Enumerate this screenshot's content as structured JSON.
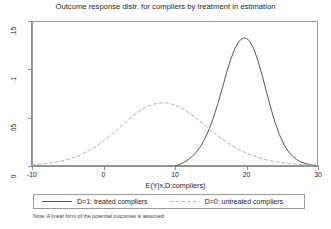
{
  "chart_data": {
    "type": "line",
    "title": "Outcome response distr. for compliers by treatment in estimation",
    "xlabel": "E(Y|x,D;compliers)",
    "ylabel": "",
    "note": "Note: A linear form of the potential outcomes is assumed",
    "grid": false,
    "legend_position": "bottom",
    "xlim": [
      -10,
      30
    ],
    "ylim": [
      0,
      0.15
    ],
    "xticks": [
      -10,
      0,
      10,
      20,
      30
    ],
    "xtick_labels": [
      "-10",
      "0",
      "10",
      "20",
      "30"
    ],
    "yticks": [
      0,
      0.05,
      0.1,
      0.15
    ],
    "ytick_labels": [
      "0",
      ".05",
      ".1",
      ".15"
    ],
    "series": [
      {
        "name": "D=1: treated compliers",
        "style": "solid",
        "color": "#555555",
        "x": [
          10.0,
          10.6,
          11.2,
          11.8,
          12.4,
          13.0,
          13.6,
          14.2,
          14.8,
          15.4,
          16.0,
          16.6,
          17.2,
          17.8,
          18.4,
          19.0,
          19.6,
          20.0,
          20.4,
          21.0,
          21.6,
          22.2,
          22.8,
          23.4,
          24.0,
          24.6,
          25.2,
          25.8,
          26.4,
          27.0,
          27.6,
          28.2,
          28.8,
          29.4,
          30.0
        ],
        "y": [
          0.0,
          0.0015,
          0.0035,
          0.0062,
          0.0098,
          0.0145,
          0.0205,
          0.0285,
          0.0385,
          0.0505,
          0.0645,
          0.08,
          0.096,
          0.1105,
          0.122,
          0.1295,
          0.1325,
          0.132,
          0.1295,
          0.1215,
          0.109,
          0.0935,
          0.0765,
          0.06,
          0.045,
          0.0325,
          0.0228,
          0.0155,
          0.0102,
          0.0066,
          0.0042,
          0.0026,
          0.0016,
          0.0009,
          0.0004
        ]
      },
      {
        "name": "D=0: untreated compliers",
        "style": "dashed",
        "color": "#b3b3b3",
        "x": [
          -10.0,
          -9.0,
          -8.0,
          -7.0,
          -6.0,
          -5.0,
          -4.0,
          -3.0,
          -2.0,
          -1.0,
          0.0,
          1.0,
          2.0,
          3.0,
          4.0,
          5.0,
          6.0,
          7.0,
          8.0,
          8.6,
          9.0,
          10.0,
          11.0,
          12.0,
          13.0,
          14.0,
          15.0,
          16.0,
          17.0,
          18.0,
          19.0,
          20.0,
          21.0,
          22.0,
          23.0,
          24.0,
          25.0,
          26.0,
          27.0,
          28.0,
          29.0,
          30.0
        ],
        "y": [
          0.0012,
          0.0018,
          0.0026,
          0.0036,
          0.005,
          0.0068,
          0.0092,
          0.0122,
          0.016,
          0.0205,
          0.0258,
          0.0318,
          0.0382,
          0.0448,
          0.0512,
          0.0568,
          0.0612,
          0.064,
          0.0652,
          0.0653,
          0.065,
          0.063,
          0.0595,
          0.0548,
          0.0492,
          0.0432,
          0.037,
          0.0312,
          0.0258,
          0.021,
          0.0168,
          0.0132,
          0.0103,
          0.0079,
          0.006,
          0.0045,
          0.0034,
          0.0025,
          0.0018,
          0.0013,
          0.0009,
          0.0006
        ]
      }
    ]
  },
  "legend": {
    "items": [
      {
        "label": "D=1: treated compliers",
        "style": "solid",
        "color": "#555555"
      },
      {
        "label": "D=0: untreated compliers",
        "style": "dashed",
        "color": "#b3b3b3"
      }
    ]
  },
  "colors": {
    "treated": "#555555",
    "untreated": "#b3b3b3",
    "axis": "#8d8d8d",
    "frame": "#9a9a9a",
    "text": "#1a1a1a",
    "background": "#ffffff"
  }
}
